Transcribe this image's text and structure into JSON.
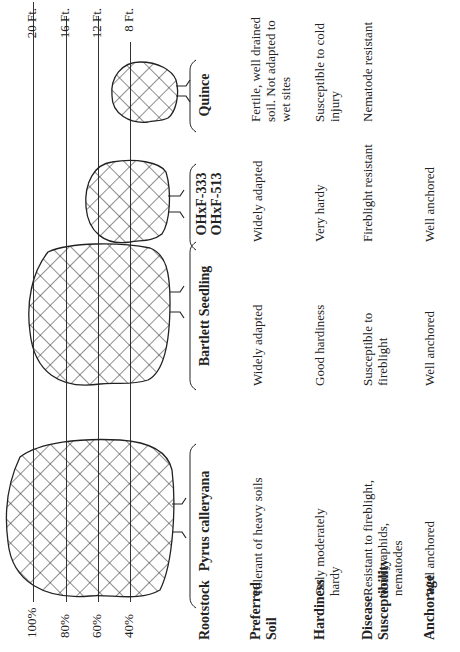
{
  "diagram": {
    "type": "rootstock-comparison",
    "orientation": "rotated-90-ccw",
    "height_scale": {
      "percent_labels": [
        "100%",
        "80%",
        "60%",
        "40%"
      ],
      "feet_labels": [
        "20 Ft.",
        "16 Ft.",
        "12 Ft.",
        "8 Ft."
      ]
    },
    "row_headers": {
      "rootstock": "Rootstock",
      "preferred_soil": "Preferred Soil",
      "hardiness": "Hardiness",
      "disease": "Disease Susceptibility",
      "anchorage": "Anchorage"
    },
    "rootstocks": [
      {
        "name": "Pyrus calleryana",
        "relative_size": "100%",
        "preferred_soil": "Tolerant of heavy soils",
        "hardiness": "Only moderately hardy",
        "disease": "Resistant to fireblight, wooly aphids, nematodes",
        "anchorage": "Well anchored"
      },
      {
        "name": "Bartlett Seedling",
        "relative_size": "~90%",
        "preferred_soil": "Widely adapted",
        "hardiness": "Good hardiness",
        "disease": "Susceptible to fireblight",
        "anchorage": "Well anchored"
      },
      {
        "name_line1": "OHxF-333",
        "name_line2": "OHxF-513",
        "relative_size": "~60%",
        "preferred_soil": "Widely adapted",
        "hardiness": "Very hardy",
        "disease": "Fireblight resistant",
        "anchorage": "Well anchored"
      },
      {
        "name": "Quince",
        "relative_size": "~45%",
        "preferred_soil": "Fertile, well drained soil. Not adapted to wet sites",
        "hardiness": "Susceptible to cold injury",
        "disease": "Nematode resistant",
        "anchorage": ""
      }
    ]
  }
}
